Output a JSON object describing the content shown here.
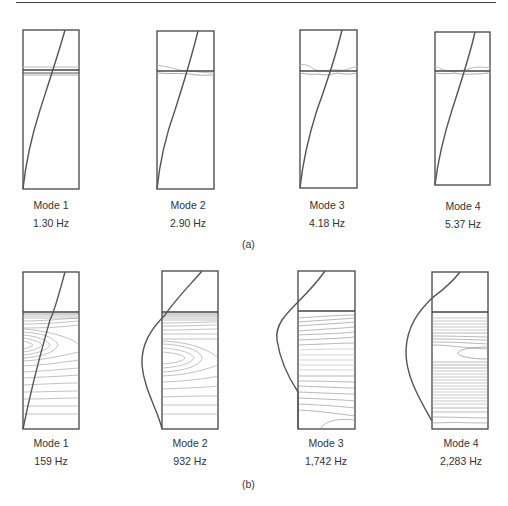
{
  "figure": {
    "rule_color": "#444444",
    "panel_a": {
      "caption": "(a)",
      "modes": [
        {
          "label": "Mode 1",
          "frequency": "1.30 Hz"
        },
        {
          "label": "Mode 2",
          "frequency": "2.90 Hz"
        },
        {
          "label": "Mode 3",
          "frequency": "4.18 Hz"
        },
        {
          "label": "Mode 4",
          "frequency": "5.37 Hz"
        }
      ]
    },
    "panel_b": {
      "caption": "(b)",
      "modes": [
        {
          "label": "Mode 1",
          "frequency": "159 Hz"
        },
        {
          "label": "Mode 2",
          "frequency": "932 Hz"
        },
        {
          "label": "Mode 3",
          "frequency": "1,742 Hz"
        },
        {
          "label": "Mode 4",
          "frequency": "2,283 Hz"
        }
      ]
    },
    "colors": {
      "frame": "#444444",
      "mode_shape": "#555555",
      "contour": "#999999",
      "surface_wave": "#aaaaaa"
    }
  }
}
